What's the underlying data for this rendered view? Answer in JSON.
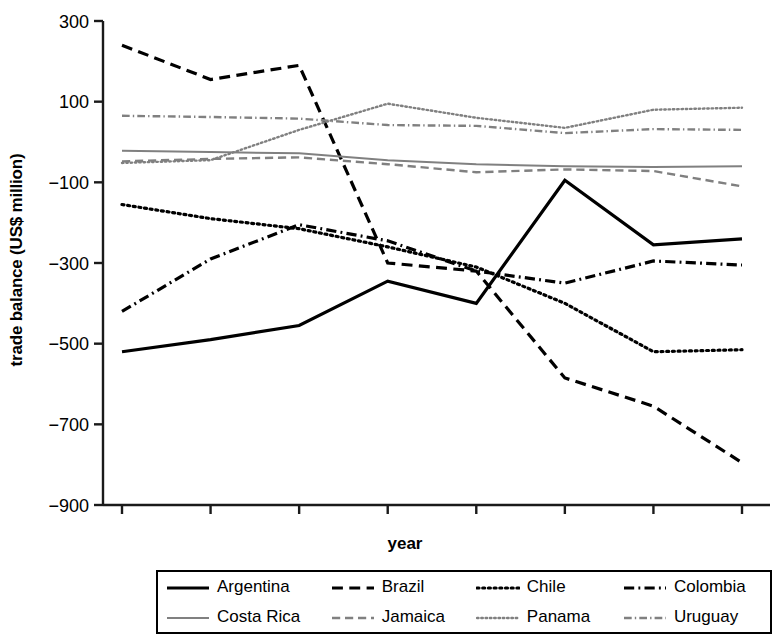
{
  "chart_data": {
    "type": "line",
    "title": "",
    "xlabel": "year",
    "ylabel": "trade balance (US$ million)",
    "x": [
      1997,
      1998,
      1999,
      2000,
      2001,
      2002,
      2003,
      2004
    ],
    "categories": [
      "1997",
      "1998",
      "1999",
      "2000",
      "2001",
      "2002",
      "2003",
      "2004"
    ],
    "xlim": [
      1996.6,
      2004.4
    ],
    "ylim": [
      -900,
      300
    ],
    "yticks": [
      -900,
      -700,
      -500,
      -300,
      -100,
      100,
      300
    ],
    "ytick_labels": [
      "−900",
      "−700",
      "−500",
      "−300",
      "−100",
      "100",
      "300"
    ],
    "grid": false,
    "legend_position": "bottom",
    "series": [
      {
        "name": "Argentina",
        "style": "solid",
        "color": "#000000",
        "width": 3.2,
        "values": [
          -520,
          -490,
          -455,
          -345,
          -400,
          -95,
          -255,
          -240
        ]
      },
      {
        "name": "Brazil",
        "style": "dashed",
        "color": "#000000",
        "width": 3.2,
        "values": [
          240,
          155,
          190,
          -300,
          -320,
          -585,
          -655,
          -795
        ]
      },
      {
        "name": "Chile",
        "style": "dotted",
        "color": "#000000",
        "width": 3.2,
        "values": [
          -155,
          -190,
          -215,
          -260,
          -310,
          -400,
          -520,
          -515
        ]
      },
      {
        "name": "Colombia",
        "style": "dashdot",
        "color": "#000000",
        "width": 3.2,
        "values": [
          -420,
          -290,
          -205,
          -245,
          -320,
          -350,
          -295,
          -305
        ]
      },
      {
        "name": "Costa Rica",
        "style": "solid",
        "color": "#808080",
        "width": 2.0,
        "values": [
          -22,
          -25,
          -28,
          -45,
          -55,
          -60,
          -62,
          -60
        ]
      },
      {
        "name": "Jamaica",
        "style": "dashed",
        "color": "#808080",
        "width": 2.4,
        "values": [
          -48,
          -42,
          -38,
          -55,
          -75,
          -68,
          -72,
          -110
        ]
      },
      {
        "name": "Panama",
        "style": "dotted",
        "color": "#808080",
        "width": 2.4,
        "values": [
          -52,
          -45,
          30,
          95,
          60,
          35,
          80,
          85
        ]
      },
      {
        "name": "Uruguay",
        "style": "dashdot",
        "color": "#808080",
        "width": 2.4,
        "values": [
          65,
          62,
          58,
          42,
          40,
          22,
          32,
          30
        ]
      }
    ]
  },
  "legend": {
    "rows": [
      [
        "Argentina",
        "Brazil",
        "Chile",
        "Colombia"
      ],
      [
        "Costa Rica",
        "Jamaica",
        "Panama",
        "Uruguay"
      ]
    ]
  }
}
